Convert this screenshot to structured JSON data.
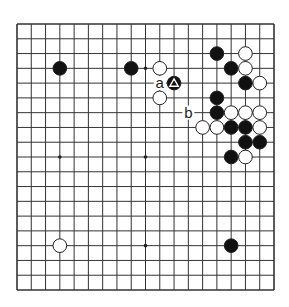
{
  "board": {
    "size": 19,
    "origin": {
      "x": 17,
      "y": 24
    },
    "extent": {
      "x": 274,
      "y": 290
    },
    "line_color": "#333333",
    "background": "#ffffff",
    "star_points": [
      [
        3,
        3
      ],
      [
        9,
        3
      ],
      [
        15,
        3
      ],
      [
        3,
        9
      ],
      [
        9,
        9
      ],
      [
        15,
        9
      ],
      [
        3,
        15
      ],
      [
        9,
        15
      ],
      [
        15,
        15
      ]
    ]
  },
  "stones": [
    {
      "color": "black",
      "col": 3,
      "row": 3
    },
    {
      "color": "black",
      "col": 8,
      "row": 3
    },
    {
      "color": "white",
      "col": 10,
      "row": 3
    },
    {
      "color": "black",
      "col": 11,
      "row": 4,
      "marker": "triangle"
    },
    {
      "color": "white",
      "col": 10,
      "row": 5
    },
    {
      "color": "black",
      "col": 14,
      "row": 2
    },
    {
      "color": "white",
      "col": 16,
      "row": 2
    },
    {
      "color": "black",
      "col": 15,
      "row": 3
    },
    {
      "color": "white",
      "col": 16,
      "row": 3
    },
    {
      "color": "black",
      "col": 16,
      "row": 4
    },
    {
      "color": "white",
      "col": 17,
      "row": 4
    },
    {
      "color": "black",
      "col": 14,
      "row": 5
    },
    {
      "color": "black",
      "col": 14,
      "row": 6
    },
    {
      "color": "white",
      "col": 15,
      "row": 6
    },
    {
      "color": "white",
      "col": 16,
      "row": 6
    },
    {
      "color": "white",
      "col": 17,
      "row": 6
    },
    {
      "color": "white",
      "col": 13,
      "row": 7
    },
    {
      "color": "white",
      "col": 14,
      "row": 7
    },
    {
      "color": "black",
      "col": 15,
      "row": 7
    },
    {
      "color": "black",
      "col": 16,
      "row": 7
    },
    {
      "color": "white",
      "col": 17,
      "row": 7
    },
    {
      "color": "black",
      "col": 16,
      "row": 8
    },
    {
      "color": "black",
      "col": 17,
      "row": 8
    },
    {
      "color": "black",
      "col": 15,
      "row": 9
    },
    {
      "color": "white",
      "col": 16,
      "row": 9
    },
    {
      "color": "white",
      "col": 3,
      "row": 15
    },
    {
      "color": "black",
      "col": 15,
      "row": 15
    }
  ],
  "labels": [
    {
      "text": "a",
      "col": 10,
      "row": 4
    },
    {
      "text": "b",
      "col": 12,
      "row": 6
    }
  ]
}
